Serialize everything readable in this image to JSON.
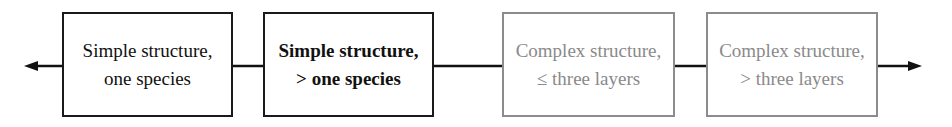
{
  "diagram": {
    "type": "linear-continuum",
    "arrows": {
      "left": "arrow-left",
      "right": "arrow-right"
    },
    "boxes": [
      {
        "line1": "Simple structure,",
        "line2": "one species",
        "style": "dark"
      },
      {
        "line1": "Simple structure,",
        "line2": "> one species",
        "style": "dark-bold"
      },
      {
        "line1": "Complex structure,",
        "line2": "≤ three layers",
        "style": "gray"
      },
      {
        "line1": "Complex structure,",
        "line2": "> three layers",
        "style": "gray"
      }
    ],
    "colors": {
      "dark": "#1a1a1a",
      "gray": "#8a8a8a"
    }
  }
}
